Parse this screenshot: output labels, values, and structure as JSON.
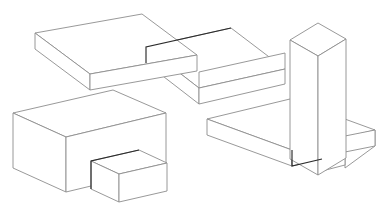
{
  "page": {
    "background_color": "#ffffff",
    "width": 383,
    "height": 211
  },
  "style": {
    "line_color_light": "#8d8d8d",
    "line_color_dark": "#2b2b2b",
    "face_color": "#ffffff",
    "line_width_light": 0.9,
    "line_width_dark": 1.15
  },
  "figures": [
    {
      "id": "figure-top-left",
      "name": "L-shaped stepped slab pair",
      "label": "",
      "parts": [
        {
          "id": "slab-upper-left",
          "name": "thin rectangular slab, upper left"
        },
        {
          "id": "slab-lower-right",
          "name": "thin rectangular slab, lower right, offset step"
        }
      ]
    },
    {
      "id": "figure-bottom-left",
      "name": "Large block with small attached front block",
      "label": "",
      "parts": [
        {
          "id": "block-large",
          "name": "large rectangular block"
        },
        {
          "id": "block-small",
          "name": "small rectangular block protruding from front face"
        }
      ]
    },
    {
      "id": "figure-right",
      "name": "Vertical column standing on a flat slab",
      "label": "",
      "parts": [
        {
          "id": "slab-base",
          "name": "flat rectangular base slab"
        },
        {
          "id": "column-vertical",
          "name": "tall vertical rectangular column"
        }
      ]
    }
  ],
  "geometry": {
    "figure_top_left": {
      "slab_a_top": "35,33 142,14 230,27 196,55 165,47 122,56",
      "slab_a_top_simple": "35,33 142,14 196,55 122,56",
      "slab_a_front_left": "35,33 35,48 65,71 122,71 122,56",
      "slab_b_top": "145,46 230,27 230,55 196,55",
      "slab_b_front": "145,46 145,62 196,88 230,75 230,55 196,55"
    },
    "figure_bottom_left": {
      "top_face": "13,113 60,90 113,90 166,113 113,141 60,141",
      "front_faces": "13,113 13,168 60,193 166,168"
    },
    "figure_right": {
      "slab_top": "207,119 248,104 375,130 331,150",
      "column_top": "290,40 318,23 345,38 318,55"
    }
  },
  "annotations": []
}
